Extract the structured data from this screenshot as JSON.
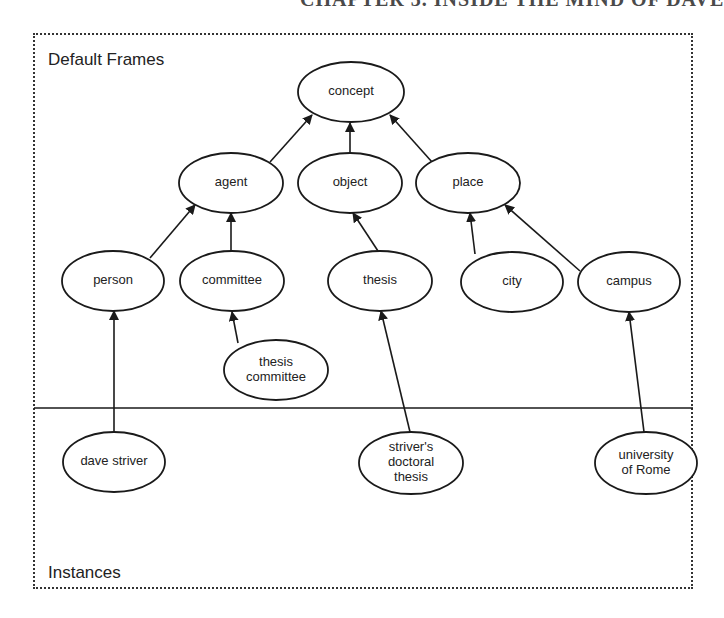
{
  "page": {
    "header_text": "CHAPTER 3. INSIDE THE MIND OF DAVE"
  },
  "diagram": {
    "sections": {
      "top_label": "Default Frames",
      "bottom_label": "Instances"
    },
    "nodes": [
      {
        "id": "concept",
        "lines": [
          "concept"
        ],
        "cx": 351,
        "cy": 92,
        "rx": 53,
        "ry": 30,
        "layer": "default"
      },
      {
        "id": "agent",
        "lines": [
          "agent"
        ],
        "cx": 231,
        "cy": 183,
        "rx": 52,
        "ry": 30,
        "layer": "default"
      },
      {
        "id": "object",
        "lines": [
          "object"
        ],
        "cx": 350,
        "cy": 183,
        "rx": 52,
        "ry": 30,
        "layer": "default"
      },
      {
        "id": "place",
        "lines": [
          "place"
        ],
        "cx": 468,
        "cy": 183,
        "rx": 52,
        "ry": 30,
        "layer": "default"
      },
      {
        "id": "person",
        "lines": [
          "person"
        ],
        "cx": 113,
        "cy": 281,
        "rx": 51,
        "ry": 30,
        "layer": "default"
      },
      {
        "id": "committee",
        "lines": [
          "committee"
        ],
        "cx": 232,
        "cy": 281,
        "rx": 52,
        "ry": 30,
        "layer": "default"
      },
      {
        "id": "thesis",
        "lines": [
          "thesis"
        ],
        "cx": 380,
        "cy": 281,
        "rx": 52,
        "ry": 30,
        "layer": "default"
      },
      {
        "id": "city",
        "lines": [
          "city"
        ],
        "cx": 512,
        "cy": 282,
        "rx": 51,
        "ry": 30,
        "layer": "default"
      },
      {
        "id": "campus",
        "lines": [
          "campus"
        ],
        "cx": 629,
        "cy": 282,
        "rx": 51,
        "ry": 30,
        "layer": "default"
      },
      {
        "id": "thesis-committee",
        "lines": [
          "thesis",
          "committee"
        ],
        "cx": 276,
        "cy": 370,
        "rx": 52,
        "ry": 30,
        "layer": "default"
      },
      {
        "id": "dave-striver",
        "lines": [
          "dave striver"
        ],
        "cx": 114,
        "cy": 462,
        "rx": 51,
        "ry": 30,
        "layer": "instance"
      },
      {
        "id": "strivers-doctoral-thesis",
        "lines": [
          "striver's",
          "doctoral",
          "thesis"
        ],
        "cx": 411,
        "cy": 463,
        "rx": 52,
        "ry": 31,
        "layer": "instance"
      },
      {
        "id": "university-of-rome",
        "lines": [
          "university",
          "of Rome"
        ],
        "cx": 646,
        "cy": 463,
        "rx": 51,
        "ry": 31,
        "layer": "instance"
      }
    ],
    "edges": [
      {
        "from": "agent",
        "to": "concept",
        "x1": 270,
        "y1": 162,
        "x2": 312,
        "y2": 115
      },
      {
        "from": "object",
        "to": "concept",
        "x1": 350,
        "y1": 153,
        "x2": 350,
        "y2": 123
      },
      {
        "from": "place",
        "to": "concept",
        "x1": 432,
        "y1": 162,
        "x2": 390,
        "y2": 115
      },
      {
        "from": "person",
        "to": "agent",
        "x1": 150,
        "y1": 258,
        "x2": 195,
        "y2": 205
      },
      {
        "from": "committee",
        "to": "agent",
        "x1": 231,
        "y1": 251,
        "x2": 231,
        "y2": 213
      },
      {
        "from": "thesis",
        "to": "object",
        "x1": 378,
        "y1": 251,
        "x2": 353,
        "y2": 213
      },
      {
        "from": "city",
        "to": "place",
        "x1": 475,
        "y1": 254,
        "x2": 470,
        "y2": 213
      },
      {
        "from": "campus",
        "to": "place",
        "x1": 580,
        "y1": 271,
        "x2": 505,
        "y2": 205
      },
      {
        "from": "thesis-committee",
        "to": "committee",
        "x1": 238,
        "y1": 343,
        "x2": 232,
        "y2": 312
      },
      {
        "from": "dave-striver",
        "to": "person",
        "x1": 114,
        "y1": 432,
        "x2": 114,
        "y2": 311
      },
      {
        "from": "strivers-doctoral-thesis",
        "to": "thesis",
        "x1": 410,
        "y1": 432,
        "x2": 381,
        "y2": 311
      },
      {
        "from": "university-of-rome",
        "to": "campus",
        "x1": 644,
        "y1": 432,
        "x2": 629,
        "y2": 312
      }
    ],
    "divider_y": 408,
    "colors": {
      "stroke": "#1a1a1a",
      "fill": "#ffffff",
      "frame_border": "#333333"
    }
  }
}
